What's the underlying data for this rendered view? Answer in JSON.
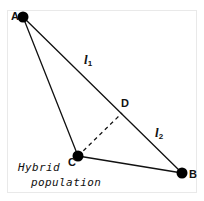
{
  "figure": {
    "caption": {
      "line1": "Hybrid",
      "line2": "population"
    },
    "colors": {
      "stroke": "#111111",
      "point_fill": "#000000",
      "background": "#ffffff",
      "frame": "#e9e9e9"
    },
    "points": [
      {
        "id": "A",
        "label": "A",
        "x": 23,
        "y": 17,
        "radius": 5.5,
        "filled": true
      },
      {
        "id": "B",
        "label": "B",
        "x": 182,
        "y": 173,
        "radius": 5.5,
        "filled": true
      },
      {
        "id": "C",
        "label": "C",
        "x": 78,
        "y": 156,
        "radius": 5.5,
        "filled": true
      },
      {
        "id": "D",
        "label": "D",
        "x": 122,
        "y": 113,
        "radius": 0,
        "filled": false
      }
    ],
    "segments": [
      {
        "id": "AB",
        "from": "A",
        "to": "B",
        "style": "solid",
        "label": "l",
        "sublabel": "1"
      },
      {
        "id": "AC",
        "from": "A",
        "to": "C",
        "style": "solid",
        "label": "",
        "sublabel": ""
      },
      {
        "id": "CB",
        "from": "C",
        "to": "B",
        "style": "solid",
        "label": "",
        "sublabel": ""
      },
      {
        "id": "CD",
        "from": "C",
        "to": "D",
        "style": "dashed",
        "label": "",
        "sublabel": ""
      }
    ],
    "segment_labels": [
      {
        "id": "l1",
        "text": "l",
        "sub": "1",
        "x": 84,
        "y": 53
      },
      {
        "id": "l2",
        "text": "l",
        "sub": "2",
        "x": 155,
        "y": 126
      }
    ]
  }
}
